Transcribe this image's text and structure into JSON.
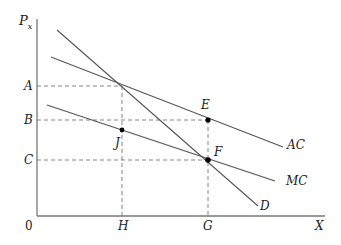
{
  "axes": {
    "y_label": "P",
    "y_subscript": "x",
    "x_label": "X",
    "origin": "0"
  },
  "y_ticks": [
    {
      "label": "A",
      "y": 86
    },
    {
      "label": "B",
      "y": 120
    },
    {
      "label": "C",
      "y": 160
    }
  ],
  "x_ticks": [
    {
      "label": "H",
      "x": 122
    },
    {
      "label": "G",
      "x": 208
    }
  ],
  "curves": [
    {
      "name": "D",
      "label": "D"
    },
    {
      "name": "AC",
      "label": "AC"
    },
    {
      "name": "MC",
      "label": "MC"
    }
  ],
  "points": [
    {
      "label": "E"
    },
    {
      "label": "F"
    },
    {
      "label": "J"
    }
  ],
  "colors": {
    "line": "#555555",
    "axis": "#777777",
    "point": "#000000"
  }
}
